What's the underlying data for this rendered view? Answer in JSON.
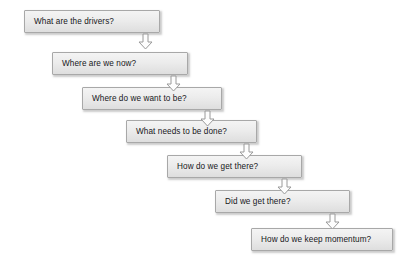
{
  "diagram": {
    "type": "flowchart-cascade",
    "title": "",
    "background_color": "#ffffff",
    "node_fill_top": "#f4f4f4",
    "node_fill_bottom": "#dedede",
    "node_border_color": "#a8a8a8",
    "node_text_color": "#17171a",
    "arrow_fill": "#fdfdfd",
    "arrow_stroke": "#9a9a9a",
    "arrow_icon_name": "down-block-arrow-icon",
    "nodes": [
      {
        "id": "n1",
        "label": "What are the drivers?",
        "x": 24,
        "y": 10,
        "w": 136,
        "h": 23
      },
      {
        "id": "n2",
        "label": "Where are we now?",
        "x": 52,
        "y": 52,
        "w": 136,
        "h": 23
      },
      {
        "id": "n3",
        "label": "Where do we want to be?",
        "x": 82,
        "y": 87,
        "w": 140,
        "h": 23
      },
      {
        "id": "n4",
        "label": "What needs to be done?",
        "x": 126,
        "y": 120,
        "w": 131,
        "h": 23
      },
      {
        "id": "n5",
        "label": "How do we get there?",
        "x": 167,
        "y": 155,
        "w": 135,
        "h": 23
      },
      {
        "id": "n6",
        "label": "Did we get there?",
        "x": 215,
        "y": 190,
        "w": 135,
        "h": 23
      },
      {
        "id": "n7",
        "label": "How do we keep momentum?",
        "x": 251,
        "y": 228,
        "w": 142,
        "h": 23
      }
    ],
    "connectors": [
      {
        "id": "a1",
        "from": "n1",
        "to": "n2",
        "x": 138,
        "y": 33
      },
      {
        "id": "a2",
        "from": "n2",
        "to": "n3",
        "x": 166,
        "y": 75
      },
      {
        "id": "a3",
        "from": "n3",
        "to": "n4",
        "x": 200,
        "y": 110
      },
      {
        "id": "a4",
        "from": "n4",
        "to": "n5",
        "x": 239,
        "y": 143
      },
      {
        "id": "a5",
        "from": "n5",
        "to": "n6",
        "x": 277,
        "y": 178
      },
      {
        "id": "a6",
        "from": "n6",
        "to": "n7",
        "x": 325,
        "y": 213
      }
    ]
  }
}
